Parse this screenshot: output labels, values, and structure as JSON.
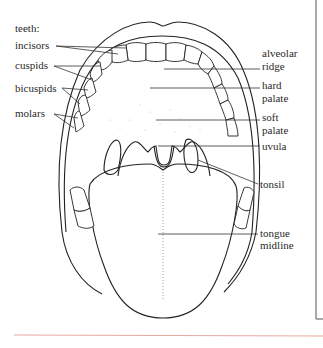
{
  "diagram": {
    "left_labels": {
      "heading": "teeth:",
      "items": [
        "incisors",
        "cuspids",
        "bicuspids",
        "molars"
      ]
    },
    "right_labels": [
      {
        "lines": [
          "alveolar",
          "ridge"
        ]
      },
      {
        "lines": [
          "hard",
          "palate"
        ]
      },
      {
        "lines": [
          "soft",
          "palate"
        ]
      },
      {
        "lines": [
          "uvula"
        ]
      },
      {
        "lines": [
          "tonsil"
        ]
      },
      {
        "lines": [
          "tongue",
          "midline"
        ]
      }
    ],
    "colors": {
      "ink": "#222222",
      "rule": "#e8a8a0",
      "border": "#555555"
    }
  }
}
